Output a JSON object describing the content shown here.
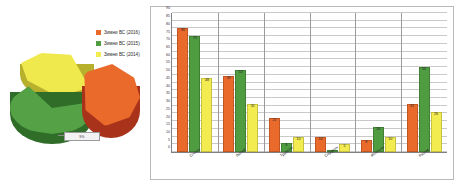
{
  "pie": {
    "callout_label": "9%",
    "legend": [
      {
        "label": "Зимни ВС (2016)",
        "color": "#ea6a2c"
      },
      {
        "label": "Зимни ВС (2015)",
        "color": "#4f9c41"
      },
      {
        "label": "Зимни ВС (2014)",
        "color": "#f2ec50"
      }
    ]
  },
  "chart_data": {
    "type": "bar",
    "title": "",
    "xlabel": "",
    "ylabel": "",
    "ylim": [
      0,
      90
    ],
    "ytick_step": 5,
    "yticks": [
      0,
      5,
      10,
      15,
      20,
      25,
      30,
      35,
      40,
      45,
      50,
      55,
      60,
      65,
      70,
      75,
      80,
      85,
      90
    ],
    "grid": true,
    "legend_position": "external-left",
    "categories": [
      "Січень",
      "Лютий",
      "Травень",
      "Серпень",
      "Жовтень",
      "Разом"
    ],
    "series": [
      {
        "name": "Зимни ВС (2016)",
        "color": "#ea6a2c",
        "values": [
          80,
          49,
          22,
          10,
          8,
          31
        ]
      },
      {
        "name": "Зимни ВС (2015)",
        "color": "#4f9c41",
        "values": [
          75,
          53,
          6,
          1,
          16,
          55
        ]
      },
      {
        "name": "Зимни ВС (2014)",
        "color": "#f2ec50",
        "values": [
          48,
          31,
          10,
          5,
          10,
          26
        ]
      }
    ]
  }
}
